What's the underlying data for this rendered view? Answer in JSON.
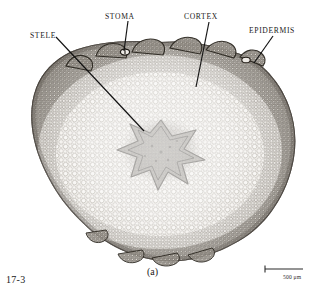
{
  "figure": {
    "number": "17-3",
    "panel_label": "(a)",
    "caption_subject": "plant stem cross section light micrograph",
    "background_color": "#ffffff",
    "ink_color": "#1a1a1a"
  },
  "annotations": {
    "labels": [
      {
        "id": "stele",
        "text": "STELE",
        "name": "annotation-label-stele",
        "leader": {
          "x1": 56,
          "y1": 37,
          "x2": 144,
          "y2": 131
        }
      },
      {
        "id": "stoma",
        "text": "STOMA",
        "name": "annotation-label-stoma",
        "leader": {
          "x1": 128,
          "y1": 21,
          "x2": 124,
          "y2": 51
        }
      },
      {
        "id": "cortex",
        "text": "CORTEX",
        "name": "annotation-label-cortex",
        "leader": {
          "x1": 209,
          "y1": 22,
          "x2": 196,
          "y2": 87
        }
      },
      {
        "id": "epidermis",
        "text": "EPIDERMIS",
        "name": "annotation-label-epidermis",
        "leader": {
          "x1": 273,
          "y1": 36,
          "x2": 254,
          "y2": 63
        }
      }
    ]
  },
  "scalebar": {
    "label": "500 μm",
    "length_px": 38,
    "x": 265,
    "y": 269,
    "tick_height": 7,
    "color": "#2a2a2a"
  },
  "specimen": {
    "description": "transverse section of a stem showing epidermis, cortex parenchyma and a central star-shaped stele",
    "center": {
      "x": 160,
      "y": 152
    },
    "radius_x": 138,
    "radius_y": 110,
    "tissues": [
      {
        "name": "epidermis",
        "appearance": "dark outer rim of small compact cells",
        "color": "#4a453f"
      },
      {
        "name": "cortex",
        "appearance": "broad zone of large pale rounded parenchyma cells",
        "color": "#8b867e"
      },
      {
        "name": "stele",
        "appearance": "central star-shaped dark vascular cylinder",
        "color": "#5a544c"
      },
      {
        "name": "stoma",
        "appearance": "pore interrupting the epidermis on the upper surface",
        "color": "#3d3832"
      }
    ]
  }
}
